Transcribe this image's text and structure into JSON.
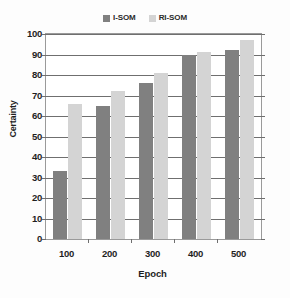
{
  "chart_data": {
    "type": "bar",
    "title": "",
    "categories": [
      "100",
      "200",
      "300",
      "400",
      "500"
    ],
    "series": [
      {
        "name": "I-SOM",
        "color": "#808080",
        "values": [
          33,
          65,
          76,
          90,
          92
        ]
      },
      {
        "name": "RI-SOM",
        "color": "#d4d4d4",
        "values": [
          66,
          72,
          81,
          91,
          97
        ]
      }
    ],
    "xlabel": "Epoch",
    "ylabel": "Certainty",
    "ylim": [
      0,
      100
    ],
    "ytick_step": 10,
    "yticks": [
      "100",
      "90",
      "80",
      "70",
      "60",
      "50",
      "40",
      "30",
      "20",
      "10",
      "0"
    ],
    "grid": true,
    "legend_position": "top-center"
  },
  "legend": {
    "entries": [
      {
        "label": "I-SOM",
        "color": "#808080"
      },
      {
        "label": "RI-SOM",
        "color": "#d4d4d4"
      }
    ]
  },
  "axes": {
    "x_title": "Epoch",
    "y_title": "Certainty"
  },
  "colors": {
    "series_1": "#808080",
    "series_2": "#d4d4d4",
    "grid": "#6f6f6f",
    "frame": "#9a9a9a",
    "text": "#1f1f1f",
    "background": "#fdfdfd",
    "plot_background": "#ffffff"
  }
}
